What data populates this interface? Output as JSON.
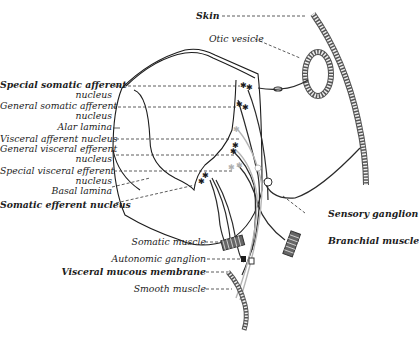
{
  "figure": {
    "labels_left": [
      {
        "id": "special-somatic-afferent",
        "text": "Special somatic afferent",
        "line2": "nucleus"
      },
      {
        "id": "general-somatic-afferent",
        "text": "General somatic afferent",
        "line2": "nucleus"
      },
      {
        "id": "alar-lamina",
        "text": "Alar lamina"
      },
      {
        "id": "visceral-afferent",
        "text": "Visceral afferent nucleus"
      },
      {
        "id": "general-visceral-efferent",
        "text": "General visceral efferent",
        "line2": "nucleus"
      },
      {
        "id": "special-visceral-efferent",
        "text": "Special visceral efferent",
        "line2": "nucleus"
      },
      {
        "id": "basal-lamina",
        "text": "Basal lamina"
      },
      {
        "id": "somatic-efferent",
        "text": "Somatic efferent nucleus"
      }
    ],
    "labels_right": [
      {
        "id": "skin",
        "text": "Skin"
      },
      {
        "id": "otic-vesicle",
        "text": "Otic vesicle"
      },
      {
        "id": "sensory-ganglion",
        "text": "Sensory ganglion"
      },
      {
        "id": "branchial-muscle",
        "text": "Branchial muscle"
      }
    ],
    "labels_bottom": [
      {
        "id": "somatic-muscle",
        "text": "Somatic muscle"
      },
      {
        "id": "autonomic-ganglion",
        "text": "Autonomic ganglion"
      },
      {
        "id": "visceral-mucous-membrane",
        "text": "Visceral mucous membrane"
      },
      {
        "id": "smooth-muscle",
        "text": "Smooth muscle"
      }
    ],
    "colors": {
      "ink": "#1c1c1c",
      "gray_fiber": "#b5b5b5"
    }
  }
}
